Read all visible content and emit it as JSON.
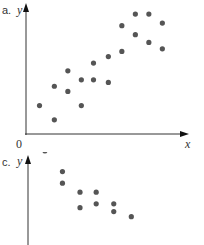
{
  "chart_data": [
    {
      "type": "scatter",
      "panel_label": "a.",
      "title": "",
      "xlabel": "x",
      "ylabel": "y",
      "origin_label": "0",
      "grid": false,
      "trend": "positive linear correlation",
      "points": [
        {
          "x": 1.0,
          "y": 2.2
        },
        {
          "x": 2.1,
          "y": 1.1
        },
        {
          "x": 2.1,
          "y": 3.7
        },
        {
          "x": 3.1,
          "y": 3.3
        },
        {
          "x": 3.1,
          "y": 4.9
        },
        {
          "x": 4.1,
          "y": 4.2
        },
        {
          "x": 4.1,
          "y": 2.2
        },
        {
          "x": 5.0,
          "y": 5.5
        },
        {
          "x": 5.0,
          "y": 4.2
        },
        {
          "x": 6.1,
          "y": 6.0
        },
        {
          "x": 6.1,
          "y": 4.0
        },
        {
          "x": 7.1,
          "y": 8.4
        },
        {
          "x": 7.1,
          "y": 6.4
        },
        {
          "x": 8.1,
          "y": 9.3
        },
        {
          "x": 8.1,
          "y": 7.7
        },
        {
          "x": 9.1,
          "y": 9.3
        },
        {
          "x": 9.1,
          "y": 7.1
        },
        {
          "x": 10.1,
          "y": 8.6
        },
        {
          "x": 10.1,
          "y": 6.6
        }
      ],
      "xlim": [
        0,
        12
      ],
      "ylim": [
        0,
        10
      ]
    },
    {
      "type": "scatter",
      "panel_label": "c.",
      "title": "",
      "xlabel": "",
      "ylabel": "y",
      "grid": false,
      "trend": "negative correlation (partially visible)",
      "points": [
        {
          "x": 1.4,
          "y": 9.0
        },
        {
          "x": 2.7,
          "y": 7.4
        },
        {
          "x": 2.7,
          "y": 6.5
        },
        {
          "x": 4.0,
          "y": 5.8
        },
        {
          "x": 5.2,
          "y": 5.8
        },
        {
          "x": 4.0,
          "y": 4.6
        },
        {
          "x": 5.2,
          "y": 4.9
        },
        {
          "x": 6.5,
          "y": 4.9
        },
        {
          "x": 6.5,
          "y": 4.3
        },
        {
          "x": 7.8,
          "y": 3.9
        }
      ]
    }
  ],
  "panels": {
    "a": {
      "letter": "a.",
      "ylabel": "y",
      "xlabel": "x",
      "origin": "0"
    },
    "c": {
      "letter": "c.",
      "ylabel": "y"
    }
  },
  "colors": {
    "dot": "#555555",
    "axis": "#333333"
  }
}
